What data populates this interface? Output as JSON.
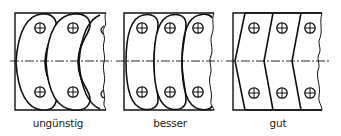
{
  "figure": {
    "panels": [
      {
        "id": "ungunstig",
        "label": "ungünstig",
        "label_x": 58,
        "shape": "curved-oval-links-overlapping"
      },
      {
        "id": "besser",
        "label": "besser",
        "label_x": 170,
        "shape": "curved-links-side-by-side"
      },
      {
        "id": "gut",
        "label": "gut",
        "label_x": 278,
        "shape": "chevron-links"
      }
    ],
    "line_color": "#111111",
    "centerline": "dash-dot"
  }
}
